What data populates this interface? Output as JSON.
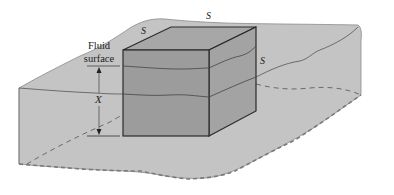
{
  "figure": {
    "labels": {
      "surface_top": "S",
      "surface_left": "S",
      "surface_right": "S",
      "fluid_surface_line1": "Fluid",
      "fluid_surface_line2": "surface",
      "depth": "X"
    },
    "colors": {
      "fluid_fill": "#c4c4c4",
      "cube_top": "#a7a7a7",
      "cube_front": "#9c9c9c",
      "cube_side": "#a3a3a3",
      "edge": "#2a2a2a",
      "outline": "#6e6e6e",
      "dashed": "#6a6a6a"
    }
  }
}
